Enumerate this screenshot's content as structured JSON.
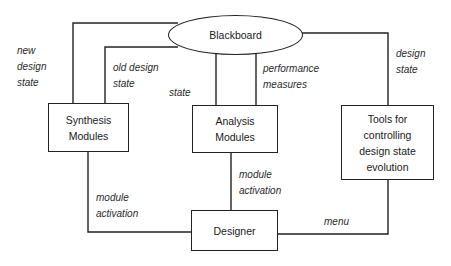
{
  "diagram": {
    "nodes": {
      "blackboard": {
        "label": "Blackboard"
      },
      "synthesis": {
        "lines": [
          "Synthesis",
          "Modules"
        ]
      },
      "analysis": {
        "lines": [
          "Analysis",
          "Modules"
        ]
      },
      "tools": {
        "lines": [
          "Tools for",
          "controlling",
          "design state",
          "evolution"
        ]
      },
      "designer": {
        "label": "Designer"
      }
    },
    "edge_labels": {
      "new_design_state": [
        "new",
        "design",
        "state"
      ],
      "old_design_state": [
        "old design",
        "state"
      ],
      "state": [
        "state"
      ],
      "performance_measures": [
        "performance",
        "measures"
      ],
      "design_state": [
        "design",
        "state"
      ],
      "module_activation_left": [
        "module",
        "activation"
      ],
      "module_activation_center": [
        "module",
        "activation"
      ],
      "menu": [
        "menu"
      ]
    },
    "edges": [
      {
        "from": "blackboard",
        "to": "synthesis",
        "label": "new design state"
      },
      {
        "from": "blackboard",
        "to": "synthesis",
        "label": "old design state"
      },
      {
        "from": "blackboard",
        "to": "analysis",
        "label": "state"
      },
      {
        "from": "blackboard",
        "to": "analysis",
        "label": "performance measures"
      },
      {
        "from": "blackboard",
        "to": "tools",
        "label": "design state"
      },
      {
        "from": "synthesis",
        "to": "designer",
        "label": "module activation"
      },
      {
        "from": "analysis",
        "to": "designer",
        "label": "module activation"
      },
      {
        "from": "tools",
        "to": "designer",
        "label": "menu"
      }
    ]
  }
}
